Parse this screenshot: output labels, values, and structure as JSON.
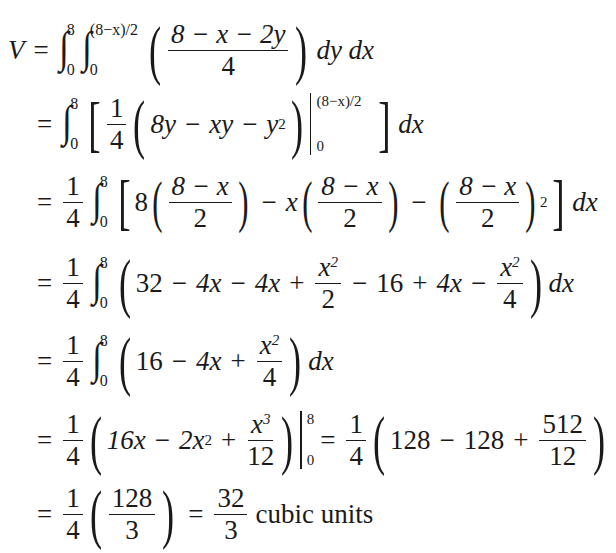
{
  "document": {
    "lines": [
      {
        "lhs": "V",
        "eq": "=",
        "outer_integral": {
          "lower": "0",
          "upper": "8"
        },
        "inner_integral": {
          "lower": "0",
          "upper": "(8−x)/2"
        },
        "integrand": {
          "numerator": "8 − x − 2y",
          "denominator": "4"
        },
        "differentials": "dy dx"
      },
      {
        "eq": "=",
        "integral": {
          "lower": "0",
          "upper": "8"
        },
        "coef": {
          "numerator": "1",
          "denominator": "4"
        },
        "expr": [
          "8y",
          "−",
          "xy",
          "−",
          "y",
          "2"
        ],
        "eval": {
          "upper": "(8−x)/2",
          "lower": "0"
        },
        "differential": "dx"
      },
      {
        "eq": "=",
        "coef": {
          "numerator": "1",
          "denominator": "4"
        },
        "integral": {
          "lower": "0",
          "upper": "8"
        },
        "terms": [
          {
            "prefix": "8",
            "numerator": "8 − x",
            "denominator": "2"
          },
          {
            "op": "−",
            "prefix": "x",
            "numerator": "8 − x",
            "denominator": "2"
          },
          {
            "op": "−",
            "numerator": "8 − x",
            "denominator": "2",
            "power": "2"
          }
        ],
        "differential": "dx"
      },
      {
        "eq": "=",
        "coef": {
          "numerator": "1",
          "denominator": "4"
        },
        "integral": {
          "lower": "0",
          "upper": "8"
        },
        "terms": [
          "32",
          "−",
          "4x",
          "−",
          "4x",
          "+"
        ],
        "frac1": {
          "numerator": "x",
          "power": "2",
          "denominator": "2"
        },
        "terms2": [
          "−",
          "16",
          "+",
          "4x",
          "−"
        ],
        "frac2": {
          "numerator": "x",
          "power": "2",
          "denominator": "4"
        },
        "differential": "dx"
      },
      {
        "eq": "=",
        "coef": {
          "numerator": "1",
          "denominator": "4"
        },
        "integral": {
          "lower": "0",
          "upper": "8"
        },
        "terms": [
          "16",
          "−",
          "4x",
          "+"
        ],
        "frac": {
          "numerator": "x",
          "power": "2",
          "denominator": "4"
        },
        "differential": "dx"
      },
      {
        "eq": "=",
        "coef": {
          "numerator": "1",
          "denominator": "4"
        },
        "terms": [
          "16x",
          "−",
          "2x",
          "2",
          "+"
        ],
        "frac": {
          "numerator": "x",
          "power": "3",
          "denominator": "12"
        },
        "eval": {
          "upper": "8",
          "lower": "0"
        },
        "eq2": "=",
        "coef2": {
          "numerator": "1",
          "denominator": "4"
        },
        "terms2": [
          "128",
          "−",
          "128",
          "+"
        ],
        "frac2": {
          "numerator": "512",
          "denominator": "12"
        }
      },
      {
        "eq": "=",
        "coef": {
          "numerator": "1",
          "denominator": "4"
        },
        "frac": {
          "numerator": "128",
          "denominator": "3"
        },
        "eq2": "=",
        "result": {
          "numerator": "32",
          "denominator": "3"
        },
        "units": "cubic units"
      }
    ]
  }
}
